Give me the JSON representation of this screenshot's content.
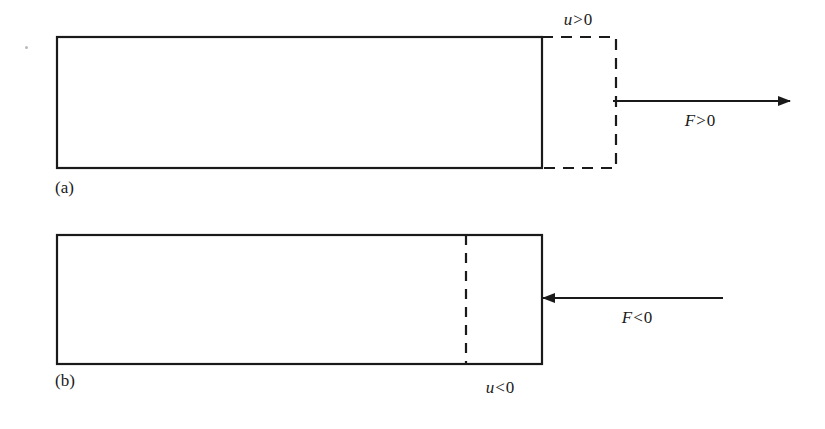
{
  "figure": {
    "background_color": "#ffffff",
    "stroke_color": "#1a1a1a",
    "panels": [
      {
        "id": "a",
        "part_label": "(a)",
        "description": "bar in tension, elongated end shown dashed",
        "bar": {
          "x": 57,
          "y": 37,
          "width": 485,
          "height": 131
        },
        "dashed_extension": {
          "x": 542,
          "y": 37,
          "width": 74,
          "height": 131
        },
        "displacement_label": "u > 0",
        "displacement_var": "u",
        "displacement_op": ">",
        "displacement_num": "0",
        "force_label": "F < 0",
        "force_var": "F",
        "force_op": ">",
        "force_num": "0",
        "arrow": {
          "x1": 613,
          "y1": 101,
          "x2": 790,
          "y2": 101,
          "direction": "right"
        }
      },
      {
        "id": "b",
        "part_label": "(b)",
        "description": "bar in compression, original end position shown as dashed line inside bar",
        "bar": {
          "x": 57,
          "y": 235,
          "width": 485,
          "height": 129
        },
        "dashed_line": {
          "x": 466,
          "y1": 235,
          "y2": 364
        },
        "displacement_label": "u < 0",
        "displacement_var": "u",
        "displacement_op": "<",
        "displacement_num": "0",
        "force_label": "F < 0",
        "force_var": "F",
        "force_op": "<",
        "force_num": "0",
        "arrow": {
          "x1": 723,
          "y1": 298,
          "x2": 543,
          "y2": 298,
          "direction": "left"
        }
      }
    ]
  }
}
